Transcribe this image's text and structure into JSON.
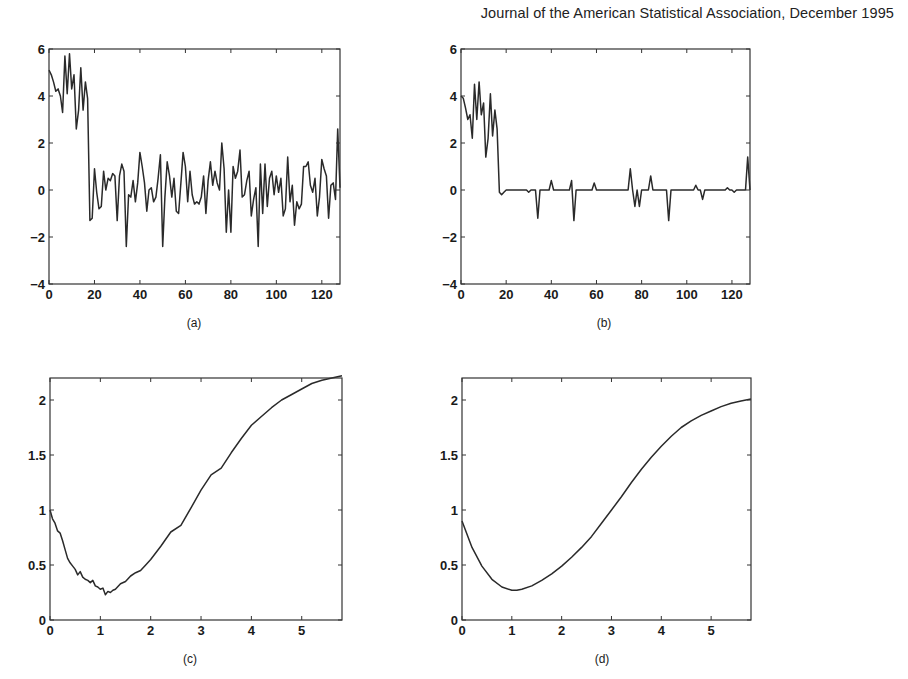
{
  "header": {
    "text": "Journal of the American Statistical Association, December 1995"
  },
  "chart_data": [
    {
      "id": "a",
      "caption": "(a)",
      "type": "line",
      "title": "",
      "xlabel": "",
      "ylabel": "",
      "xlim": [
        0,
        128
      ],
      "ylim": [
        -4,
        6
      ],
      "xticks": [
        0,
        20,
        40,
        60,
        80,
        100,
        120
      ],
      "yticks": [
        -4,
        -2,
        0,
        2,
        4,
        6
      ],
      "grid": false,
      "x_start": 0,
      "x_step": 1,
      "values": [
        5.1,
        4.9,
        4.6,
        4.2,
        4.3,
        4.0,
        3.3,
        5.7,
        4.1,
        5.8,
        4.3,
        4.9,
        2.6,
        3.4,
        5.2,
        3.4,
        4.6,
        3.9,
        -1.3,
        -1.2,
        0.9,
        -0.1,
        -0.8,
        -0.7,
        0.8,
        0.0,
        0.5,
        0.4,
        0.7,
        0.6,
        -1.3,
        0.6,
        1.1,
        0.8,
        -2.4,
        -0.2,
        -0.3,
        0.4,
        -0.5,
        0.3,
        1.6,
        1.0,
        0.3,
        -0.9,
        0.0,
        0.1,
        -0.5,
        -0.3,
        0.5,
        1.5,
        -2.4,
        -0.3,
        1.2,
        0.6,
        -0.3,
        0.5,
        -0.9,
        -1.0,
        0.3,
        1.6,
        1.0,
        -0.5,
        0.8,
        -0.2,
        -0.6,
        -0.5,
        -0.6,
        -0.3,
        0.6,
        -1.0,
        0.4,
        1.2,
        0.2,
        0.8,
        0.3,
        0.0,
        2.0,
        0.9,
        -1.8,
        0.0,
        -1.8,
        1.0,
        0.5,
        0.8,
        1.7,
        -0.3,
        -0.2,
        0.4,
        0.8,
        -1.1,
        -0.4,
        0.1,
        -2.4,
        1.1,
        -1.0,
        1.1,
        -0.7,
        0.5,
        0.8,
        -0.2,
        0.6,
        -0.1,
        0.5,
        -1.1,
        -0.8,
        1.4,
        -0.5,
        0.2,
        -1.5,
        -0.5,
        -0.8,
        -0.6,
        1.0,
        1.0,
        1.2,
        0.2,
        -0.1,
        0.5,
        -1.1,
        -0.3,
        1.3,
        0.9,
        0.6,
        -1.2,
        0.2,
        0.3,
        -0.4,
        2.6,
        0.1
      ]
    },
    {
      "id": "b",
      "caption": "(b)",
      "type": "line",
      "title": "",
      "xlabel": "",
      "ylabel": "",
      "xlim": [
        0,
        128
      ],
      "ylim": [
        -4,
        6
      ],
      "xticks": [
        0,
        20,
        40,
        60,
        80,
        100,
        120
      ],
      "yticks": [
        -4,
        -2,
        0,
        2,
        4,
        6
      ],
      "grid": false,
      "x_start": 0,
      "x_step": 1,
      "values": [
        4.0,
        3.9,
        3.5,
        3.0,
        3.2,
        2.2,
        4.5,
        3.0,
        4.6,
        3.2,
        3.7,
        1.4,
        2.2,
        4.1,
        2.3,
        3.4,
        2.6,
        -0.1,
        -0.2,
        -0.1,
        0.0,
        0.0,
        0.0,
        0.0,
        0.0,
        0.0,
        0.0,
        0.0,
        0.0,
        0.0,
        -0.1,
        0.0,
        0.0,
        0.0,
        -1.2,
        0.0,
        0.0,
        0.0,
        0.0,
        0.0,
        0.4,
        0.0,
        0.0,
        0.0,
        0.0,
        0.0,
        0.0,
        0.0,
        0.0,
        0.4,
        -1.3,
        0.0,
        0.0,
        0.0,
        0.0,
        0.0,
        0.0,
        0.0,
        0.0,
        0.3,
        0.0,
        0.0,
        0.0,
        0.0,
        0.0,
        0.0,
        0.0,
        0.0,
        0.0,
        0.0,
        0.0,
        0.0,
        0.0,
        0.0,
        0.0,
        0.9,
        0.0,
        -0.7,
        0.0,
        -0.7,
        0.0,
        0.0,
        0.0,
        0.0,
        0.6,
        0.0,
        0.0,
        0.0,
        0.0,
        0.0,
        0.0,
        0.0,
        -1.3,
        0.0,
        0.0,
        0.0,
        0.0,
        0.0,
        0.0,
        0.0,
        0.0,
        0.0,
        0.0,
        0.0,
        0.2,
        0.0,
        0.0,
        -0.4,
        0.0,
        0.0,
        0.0,
        0.0,
        0.0,
        0.0,
        0.0,
        0.0,
        0.0,
        0.0,
        0.1,
        0.0,
        0.0,
        -0.1,
        0.0,
        0.0,
        0.0,
        0.0,
        0.0,
        1.4,
        0.0
      ]
    },
    {
      "id": "c",
      "caption": "(c)",
      "type": "line",
      "title": "",
      "xlabel": "",
      "ylabel": "",
      "xlim": [
        0,
        5.8
      ],
      "ylim": [
        0,
        2.2
      ],
      "xticks": [
        0,
        1,
        2,
        3,
        4,
        5
      ],
      "yticks": [
        0,
        0.5,
        1,
        1.5,
        2
      ],
      "ytick_labels": [
        "0",
        "0.5",
        "1",
        "1.5",
        "2"
      ],
      "grid": false,
      "x": [
        0,
        0.05,
        0.1,
        0.15,
        0.2,
        0.25,
        0.3,
        0.35,
        0.4,
        0.45,
        0.5,
        0.55,
        0.6,
        0.65,
        0.7,
        0.75,
        0.8,
        0.85,
        0.9,
        0.95,
        1.0,
        1.05,
        1.1,
        1.15,
        1.2,
        1.25,
        1.3,
        1.4,
        1.5,
        1.6,
        1.7,
        1.8,
        1.9,
        2.0,
        2.2,
        2.4,
        2.6,
        2.8,
        3.0,
        3.2,
        3.4,
        3.6,
        3.8,
        4.0,
        4.2,
        4.4,
        4.6,
        4.8,
        5.0,
        5.2,
        5.4,
        5.6,
        5.8
      ],
      "values": [
        1.0,
        0.92,
        0.88,
        0.81,
        0.79,
        0.72,
        0.64,
        0.56,
        0.52,
        0.49,
        0.46,
        0.41,
        0.44,
        0.39,
        0.37,
        0.36,
        0.34,
        0.36,
        0.31,
        0.3,
        0.28,
        0.29,
        0.23,
        0.26,
        0.25,
        0.27,
        0.28,
        0.33,
        0.35,
        0.4,
        0.43,
        0.45,
        0.5,
        0.55,
        0.67,
        0.8,
        0.86,
        1.02,
        1.18,
        1.32,
        1.38,
        1.52,
        1.65,
        1.77,
        1.85,
        1.93,
        2.0,
        2.05,
        2.1,
        2.15,
        2.18,
        2.2,
        2.22
      ]
    },
    {
      "id": "d",
      "caption": "(d)",
      "type": "line",
      "title": "",
      "xlabel": "",
      "ylabel": "",
      "xlim": [
        0,
        5.8
      ],
      "ylim": [
        0,
        2.2
      ],
      "xticks": [
        0,
        1,
        2,
        3,
        4,
        5
      ],
      "yticks": [
        0,
        0.5,
        1,
        1.5,
        2
      ],
      "ytick_labels": [
        "0",
        "0.5",
        "1",
        "1.5",
        "2"
      ],
      "grid": false,
      "x": [
        0,
        0.2,
        0.4,
        0.6,
        0.8,
        1.0,
        1.1,
        1.2,
        1.4,
        1.6,
        1.8,
        2.0,
        2.2,
        2.4,
        2.6,
        2.8,
        3.0,
        3.2,
        3.4,
        3.6,
        3.8,
        4.0,
        4.2,
        4.4,
        4.6,
        4.8,
        5.0,
        5.2,
        5.4,
        5.6,
        5.8
      ],
      "values": [
        0.9,
        0.66,
        0.49,
        0.37,
        0.3,
        0.27,
        0.27,
        0.28,
        0.31,
        0.36,
        0.42,
        0.49,
        0.57,
        0.66,
        0.76,
        0.88,
        1.0,
        1.12,
        1.25,
        1.37,
        1.48,
        1.58,
        1.67,
        1.75,
        1.81,
        1.86,
        1.9,
        1.94,
        1.97,
        1.99,
        2.01
      ]
    }
  ],
  "panels": {
    "a": {
      "caption": "(a)"
    },
    "b": {
      "caption": "(b)"
    },
    "c": {
      "caption": "(c)"
    },
    "d": {
      "caption": "(d)"
    }
  },
  "style": {
    "line_color": "#2a2a2a",
    "axis_color": "#333333",
    "background": "#ffffff"
  }
}
